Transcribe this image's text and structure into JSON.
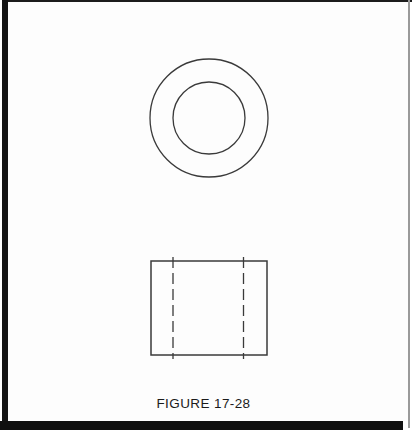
{
  "page": {
    "background": "#ffffff",
    "frame_color": "#141414",
    "right_edge_color": "#9a9a9a"
  },
  "figure": {
    "caption": "FIGURE 17-28",
    "drawing_type": "orthographic-two-view",
    "line_color": "#3a3a3a",
    "top_view": {
      "shape": "concentric-circles",
      "cx": 209,
      "cy": 118,
      "outer_r": 59,
      "inner_r": 36
    },
    "front_view": {
      "shape": "rectangle-with-hidden-lines",
      "x": 151,
      "y": 261,
      "width": 116,
      "height": 94,
      "hidden_lines": [
        173,
        243.5
      ],
      "hidden_line_top": 257,
      "hidden_line_bottom": 359,
      "dash_pattern": "11 5"
    }
  }
}
